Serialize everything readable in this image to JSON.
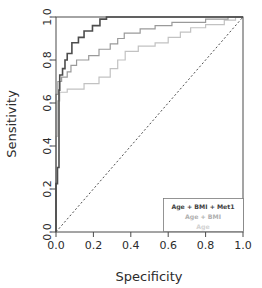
{
  "chart_data": {
    "type": "line",
    "title": "",
    "xlabel": "Specificity",
    "ylabel": "Sensitivity",
    "xlim": [
      0.0,
      1.0
    ],
    "ylim": [
      0.0,
      1.0
    ],
    "xticks": [
      "0.0",
      "0.2",
      "0.4",
      "0.6",
      "0.8",
      "1.0"
    ],
    "xtick_values": [
      0.0,
      0.2,
      0.4,
      0.6,
      0.8,
      1.0
    ],
    "yticks": [
      "0.0",
      "0.2",
      "0.4",
      "0.6",
      "0.8",
      "1.0"
    ],
    "ytick_values": [
      0.0,
      0.2,
      0.4,
      0.6,
      0.8,
      1.0
    ],
    "grid": false,
    "legend_position": "bottom-right",
    "reference_line": {
      "name": "chance-diagonal",
      "style": "dashed",
      "from": [
        0.0,
        0.0
      ],
      "to": [
        1.0,
        1.0
      ],
      "color": "#3a3a3a"
    },
    "series": [
      {
        "name": "Age + BMI + Met1",
        "color": "#4d4d4d",
        "width": 1.6,
        "points": [
          [
            0.0,
            0.0
          ],
          [
            0.0,
            0.225
          ],
          [
            0.008,
            0.225
          ],
          [
            0.008,
            0.3
          ],
          [
            0.016,
            0.3
          ],
          [
            0.016,
            0.66
          ],
          [
            0.02,
            0.66
          ],
          [
            0.02,
            0.73
          ],
          [
            0.035,
            0.73
          ],
          [
            0.035,
            0.76
          ],
          [
            0.048,
            0.76
          ],
          [
            0.048,
            0.8
          ],
          [
            0.06,
            0.8
          ],
          [
            0.06,
            0.83
          ],
          [
            0.085,
            0.83
          ],
          [
            0.085,
            0.88
          ],
          [
            0.12,
            0.88
          ],
          [
            0.12,
            0.905
          ],
          [
            0.15,
            0.905
          ],
          [
            0.15,
            0.935
          ],
          [
            0.195,
            0.935
          ],
          [
            0.195,
            0.96
          ],
          [
            0.235,
            0.96
          ],
          [
            0.235,
            0.99
          ],
          [
            0.27,
            0.99
          ],
          [
            0.27,
            1.0
          ],
          [
            1.0,
            1.0
          ]
        ]
      },
      {
        "name": "Age + BMI",
        "color": "#9a9a9a",
        "width": 1.2,
        "points": [
          [
            0.0,
            0.0
          ],
          [
            0.0,
            0.64
          ],
          [
            0.01,
            0.64
          ],
          [
            0.01,
            0.7
          ],
          [
            0.03,
            0.7
          ],
          [
            0.03,
            0.72
          ],
          [
            0.06,
            0.72
          ],
          [
            0.06,
            0.745
          ],
          [
            0.08,
            0.745
          ],
          [
            0.08,
            0.775
          ],
          [
            0.11,
            0.775
          ],
          [
            0.11,
            0.8
          ],
          [
            0.175,
            0.8
          ],
          [
            0.175,
            0.82
          ],
          [
            0.23,
            0.82
          ],
          [
            0.23,
            0.85
          ],
          [
            0.29,
            0.85
          ],
          [
            0.29,
            0.875
          ],
          [
            0.33,
            0.875
          ],
          [
            0.33,
            0.9
          ],
          [
            0.365,
            0.9
          ],
          [
            0.365,
            0.925
          ],
          [
            0.45,
            0.925
          ],
          [
            0.45,
            0.945
          ],
          [
            0.53,
            0.945
          ],
          [
            0.53,
            0.96
          ],
          [
            0.62,
            0.96
          ],
          [
            0.62,
            0.975
          ],
          [
            0.8,
            0.975
          ],
          [
            0.8,
            0.99
          ],
          [
            0.92,
            0.99
          ],
          [
            0.92,
            1.0
          ],
          [
            1.0,
            1.0
          ]
        ]
      },
      {
        "name": "Age",
        "color": "#c2c2c2",
        "width": 1.2,
        "points": [
          [
            0.0,
            0.0
          ],
          [
            0.0,
            0.445
          ],
          [
            0.008,
            0.445
          ],
          [
            0.008,
            0.61
          ],
          [
            0.02,
            0.61
          ],
          [
            0.02,
            0.65
          ],
          [
            0.06,
            0.65
          ],
          [
            0.06,
            0.665
          ],
          [
            0.15,
            0.665
          ],
          [
            0.15,
            0.69
          ],
          [
            0.23,
            0.69
          ],
          [
            0.23,
            0.72
          ],
          [
            0.29,
            0.72
          ],
          [
            0.29,
            0.76
          ],
          [
            0.33,
            0.76
          ],
          [
            0.33,
            0.8
          ],
          [
            0.37,
            0.8
          ],
          [
            0.37,
            0.84
          ],
          [
            0.44,
            0.84
          ],
          [
            0.44,
            0.865
          ],
          [
            0.53,
            0.865
          ],
          [
            0.53,
            0.88
          ],
          [
            0.6,
            0.88
          ],
          [
            0.6,
            0.905
          ],
          [
            0.665,
            0.905
          ],
          [
            0.665,
            0.93
          ],
          [
            0.72,
            0.93
          ],
          [
            0.72,
            0.95
          ],
          [
            0.8,
            0.95
          ],
          [
            0.8,
            0.965
          ],
          [
            0.9,
            0.965
          ],
          [
            0.9,
            0.985
          ],
          [
            0.96,
            0.985
          ],
          [
            0.96,
            1.0
          ],
          [
            1.0,
            1.0
          ]
        ]
      }
    ],
    "legend": {
      "entries": [
        {
          "label": "Age + BMI + Met1",
          "color": "#3f3f3f"
        },
        {
          "label": "Age + BMI",
          "color": "#b0b0b0"
        },
        {
          "label": "Age",
          "color": "#d2d2d2"
        }
      ]
    }
  }
}
